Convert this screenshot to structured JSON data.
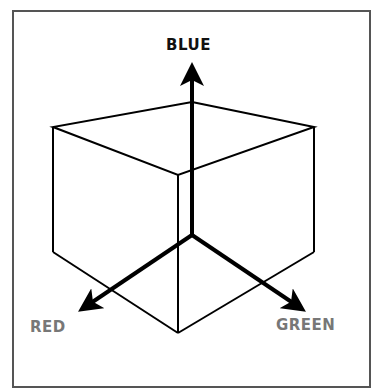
{
  "diagram": {
    "type": "rgb-color-cube",
    "axes": [
      {
        "label": "BLUE",
        "direction": "up",
        "color": "#111111"
      },
      {
        "label": "RED",
        "direction": "down-left",
        "color": "#777777"
      },
      {
        "label": "GREEN",
        "direction": "down-right",
        "color": "#777777"
      }
    ]
  },
  "labels": {
    "blue": "BLUE",
    "red": "RED",
    "green": "GREEN"
  }
}
